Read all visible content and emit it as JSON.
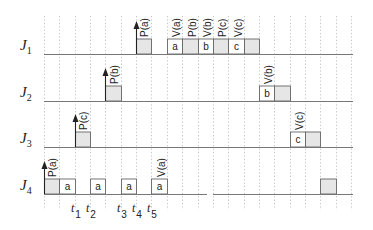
{
  "diagram": {
    "type": "timing-diagram",
    "grid": {
      "x_start": 44,
      "step": 15.35,
      "columns": 21,
      "y_top": 16,
      "y_bottom": 210,
      "color": "#b5b5b5"
    },
    "axis_end_x": 353,
    "box_height": 15,
    "colors": {
      "line": "#777777",
      "box_stroke": "#666666",
      "shaded_fill": "#e6e6e6",
      "white_fill": "#ffffff",
      "arrow": "#222222"
    },
    "rows": [
      {
        "label": "J",
        "sub": "1",
        "baseline": 54,
        "arrow": {
          "col": 6
        },
        "boxes": [
          {
            "col": 6,
            "shaded": true,
            "text": ""
          },
          {
            "col": 8,
            "shaded": false,
            "text": "a"
          },
          {
            "col": 9,
            "shaded": true,
            "text": ""
          },
          {
            "col": 10,
            "shaded": false,
            "text": "b"
          },
          {
            "col": 11,
            "shaded": true,
            "text": ""
          },
          {
            "col": 12,
            "shaded": false,
            "text": "c"
          },
          {
            "col": 13,
            "shaded": true,
            "text": ""
          }
        ],
        "ops": [
          {
            "col": 7,
            "text": "P(a)",
            "offset": -1
          },
          {
            "col": 9,
            "text": "V(a)",
            "offset": 0
          },
          {
            "col": 10,
            "text": "P(b)",
            "offset": 0
          },
          {
            "col": 11,
            "text": "V(b)",
            "offset": 0
          },
          {
            "col": 12,
            "text": "P(c)",
            "offset": 0
          },
          {
            "col": 13,
            "text": "V(c)",
            "offset": 0
          }
        ],
        "gaps": []
      },
      {
        "label": "J",
        "sub": "2",
        "baseline": 101,
        "arrow": {
          "col": 4
        },
        "boxes": [
          {
            "col": 4,
            "shaded": true,
            "text": ""
          },
          {
            "col": 14,
            "shaded": false,
            "text": "b"
          },
          {
            "col": 15,
            "shaded": true,
            "text": ""
          }
        ],
        "ops": [
          {
            "col": 5,
            "text": "P(b)",
            "offset": -1
          },
          {
            "col": 15,
            "text": "V(b)",
            "offset": 0
          }
        ],
        "gaps": []
      },
      {
        "label": "J",
        "sub": "3",
        "baseline": 147,
        "arrow": {
          "col": 2
        },
        "boxes": [
          {
            "col": 2,
            "shaded": true,
            "text": ""
          },
          {
            "col": 16,
            "shaded": false,
            "text": "c"
          },
          {
            "col": 17,
            "shaded": true,
            "text": ""
          }
        ],
        "ops": [
          {
            "col": 3,
            "text": "P(c)",
            "offset": -1
          },
          {
            "col": 17,
            "text": "V(c)",
            "offset": 0
          }
        ],
        "gaps": []
      },
      {
        "label": "J",
        "sub": "4",
        "baseline": 194,
        "arrow": {
          "col": 0
        },
        "boxes": [
          {
            "col": 0,
            "shaded": true,
            "text": ""
          },
          {
            "col": 1,
            "shaded": false,
            "text": "a"
          },
          {
            "col": 3,
            "shaded": false,
            "text": "a"
          },
          {
            "col": 5,
            "shaded": false,
            "text": "a"
          },
          {
            "col": 7,
            "shaded": false,
            "text": "a"
          },
          {
            "col": 18,
            "shaded": true,
            "text": ""
          }
        ],
        "ops": [
          {
            "col": 1,
            "text": "P(a)",
            "offset": -1
          },
          {
            "col": 8,
            "text": "V(a)",
            "offset": 0
          }
        ],
        "gaps": [
          {
            "x1": 207,
            "x2": 213
          }
        ]
      }
    ],
    "time_marks": [
      {
        "text": "t",
        "sub": "1",
        "col": 2
      },
      {
        "text": "t",
        "sub": "2",
        "col": 3
      },
      {
        "text": "t",
        "sub": "3",
        "col": 5
      },
      {
        "text": "t",
        "sub": "4",
        "col": 6
      },
      {
        "text": "t",
        "sub": "5",
        "col": 7
      }
    ],
    "time_label_y": 216
  }
}
